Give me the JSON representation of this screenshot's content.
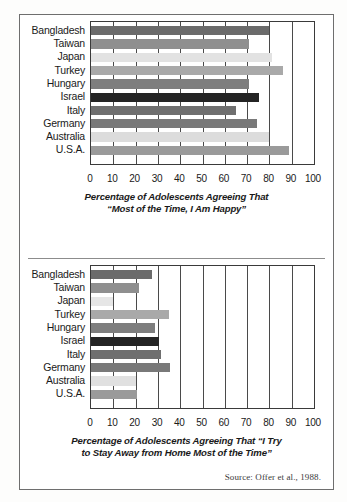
{
  "figure": {
    "source_note": "Source: Offer et al., 1988."
  },
  "chart_data": [
    {
      "type": "bar",
      "orientation": "horizontal",
      "title": "",
      "axis_title_line1": "Percentage of Adolescents Agreeing That",
      "axis_title_line2": "“Most of the Time, I Am Happy”",
      "xlabel": "Percentage of Adolescents Agreeing That “Most of the Time, I Am Happy”",
      "ylabel": "",
      "categories": [
        "Bangladesh",
        "Taiwan",
        "Japan",
        "Turkey",
        "Hungary",
        "Israel",
        "Italy",
        "Germany",
        "Australia",
        "U.S.A."
      ],
      "values": [
        80,
        71,
        81,
        86,
        71,
        75.5,
        65,
        74.5,
        80,
        89
      ],
      "colors": [
        "#6b6b6b",
        "#8f8f8f",
        "#e2e2e2",
        "#a9a9a9",
        "#7e7e7e",
        "#242424",
        "#6f6f6f",
        "#797979",
        "#dcdcdc",
        "#9a9a9a"
      ],
      "xlim": [
        0,
        100
      ],
      "xticks": [
        0,
        10,
        20,
        30,
        40,
        50,
        60,
        70,
        80,
        90,
        100
      ],
      "xticklabels": [
        "0",
        "10",
        "20",
        "30",
        "40",
        "50",
        "60",
        "70",
        "80",
        "90",
        "100"
      ],
      "grid": true
    },
    {
      "type": "bar",
      "orientation": "horizontal",
      "title": "",
      "axis_title_line1": "Percentage of Adolescents Agreeing That “I Try",
      "axis_title_line2": "to Stay Away from Home Most of the Time”",
      "xlabel": "Percentage of Adolescents Agreeing That “I Try to Stay Away from Home Most of the Time”",
      "ylabel": "",
      "categories": [
        "Bangladesh",
        "Taiwan",
        "Japan",
        "Turkey",
        "Hungary",
        "Israel",
        "Italy",
        "Germany",
        "Australia",
        "U.S.A."
      ],
      "values": [
        27.5,
        21.5,
        10,
        35,
        28.5,
        30.5,
        31.5,
        35.5,
        20,
        20.5
      ],
      "colors": [
        "#6b6b6b",
        "#8f8f8f",
        "#e6e6e6",
        "#a9a9a9",
        "#7e7e7e",
        "#242424",
        "#6f6f6f",
        "#797979",
        "#e0e0e0",
        "#9a9a9a"
      ],
      "xlim": [
        0,
        100
      ],
      "xticks": [
        0,
        10,
        20,
        30,
        40,
        50,
        60,
        70,
        80,
        90,
        100
      ],
      "xticklabels": [
        "0",
        "10",
        "20",
        "30",
        "40",
        "50",
        "60",
        "70",
        "80",
        "90",
        "100"
      ],
      "grid": true
    }
  ]
}
